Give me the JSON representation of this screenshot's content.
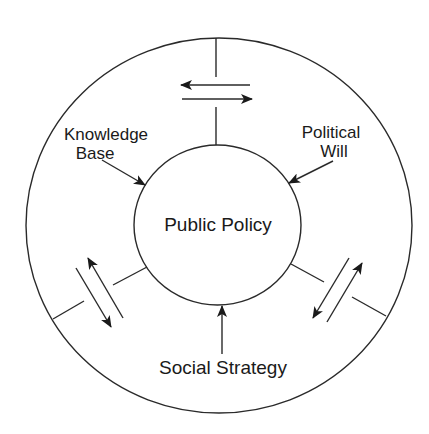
{
  "diagram": {
    "center_label": "Public Policy",
    "inputs": [
      {
        "id": "knowledge-base",
        "lines": [
          "Knowledge",
          "Base"
        ]
      },
      {
        "id": "political-will",
        "lines": [
          "Political",
          "Will"
        ]
      },
      {
        "id": "social-strategy",
        "lines": [
          "Social Strategy"
        ]
      }
    ],
    "colors": {
      "stroke": "#2a2a2a",
      "text": "#1a1a1a",
      "background": "#ffffff"
    }
  }
}
